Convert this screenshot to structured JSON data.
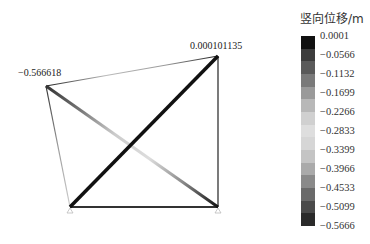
{
  "legend": {
    "title": "竖向位移/m",
    "ticks": [
      "0.0001",
      "−0.0566",
      "−0.1132",
      "−0.1699",
      "−0.2266",
      "−0.2833",
      "−0.3399",
      "−0.3966",
      "−0.4533",
      "−0.5099",
      "−0.5666"
    ],
    "colors": [
      "#111111",
      "#3c3c3c",
      "#5a5a5a",
      "#7a7a7a",
      "#9a9a9a",
      "#b8b8b8",
      "#d0d0d0",
      "#dedede",
      "#d6d6d6",
      "#c4c4c4",
      "#aaaaaa",
      "#8a8a8a",
      "#6a6a6a",
      "#4a4a4a",
      "#2a2a2a"
    ]
  },
  "annotations": {
    "max_label": "0.000101135",
    "min_label": "−0.566618"
  },
  "nodes": {
    "top_left": [
      46,
      86
    ],
    "top_right": [
      218,
      56
    ],
    "bottom_left": [
      70,
      207
    ],
    "bottom_right": [
      218,
      207
    ]
  }
}
